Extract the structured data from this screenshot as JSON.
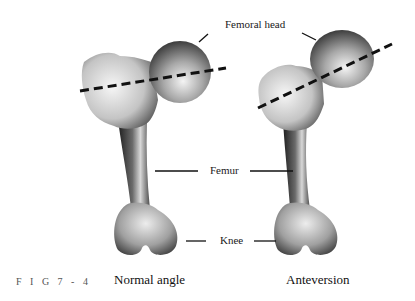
{
  "figure": {
    "number_label": "F I G  7 - 4",
    "labels": {
      "femoral_head": "Femoral head",
      "femur": "Femur",
      "knee": "Knee"
    },
    "captions": {
      "left": "Normal angle",
      "right": "Anteversion"
    },
    "axis_line_style": "dashed",
    "colors": {
      "bone_light": "#e8e8e8",
      "bone_mid": "#9a9a9a",
      "bone_dark": "#2a2a2a",
      "line": "#111111"
    }
  }
}
